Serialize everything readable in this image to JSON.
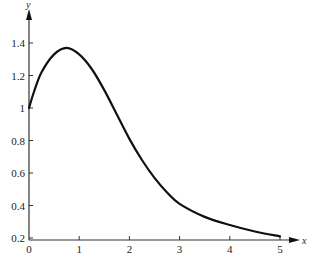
{
  "chart_data": {
    "type": "line",
    "title": "",
    "xlabel": "x",
    "ylabel": "y",
    "xlim": [
      0,
      5.5
    ],
    "ylim": [
      0.2,
      1.5
    ],
    "grid": false,
    "legend": null,
    "x_ticks": [
      "0",
      "1",
      "2",
      "3",
      "4",
      "5"
    ],
    "y_ticks": [
      "0.2",
      "0.4",
      "0.6",
      "0.8",
      "1",
      "1.2",
      "1.4"
    ],
    "series": [
      {
        "name": "y(x)",
        "color": "#111111",
        "x": [
          0,
          0.1,
          0.25,
          0.5,
          0.75,
          1.0,
          1.25,
          1.5,
          1.75,
          2.0,
          2.25,
          2.5,
          2.75,
          3.0,
          3.5,
          4.0,
          4.5,
          5.0
        ],
        "y": [
          1.0,
          1.1,
          1.22,
          1.33,
          1.37,
          1.33,
          1.24,
          1.11,
          0.96,
          0.81,
          0.68,
          0.57,
          0.48,
          0.41,
          0.33,
          0.28,
          0.24,
          0.21
        ]
      }
    ]
  }
}
